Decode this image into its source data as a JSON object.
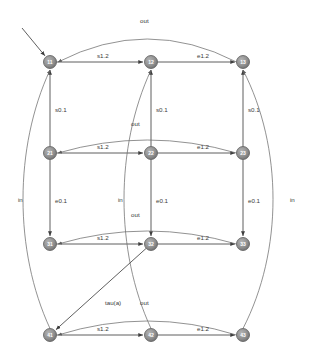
{
  "diagram": {
    "type": "automaton",
    "node_fill": "#8c8c8c",
    "node_stroke": "#5a5a5a",
    "edge_color": "#4d4d4d",
    "curve_color": "#6e6e6e",
    "label_color": "#3a3a3a",
    "node_radius": 6.5,
    "nodes": [
      {
        "id": "n11",
        "label": "11",
        "x": 50,
        "y": 62,
        "initial": true
      },
      {
        "id": "n12",
        "label": "12",
        "x": 151,
        "y": 62,
        "initial": false
      },
      {
        "id": "n13",
        "label": "13",
        "x": 243,
        "y": 62,
        "initial": false
      },
      {
        "id": "n21",
        "label": "21",
        "x": 50,
        "y": 153,
        "initial": false
      },
      {
        "id": "n22",
        "label": "22",
        "x": 151,
        "y": 153,
        "initial": false
      },
      {
        "id": "n23",
        "label": "23",
        "x": 243,
        "y": 153,
        "initial": false
      },
      {
        "id": "n31",
        "label": "31",
        "x": 50,
        "y": 244,
        "initial": false
      },
      {
        "id": "n32",
        "label": "32",
        "x": 151,
        "y": 244,
        "initial": false
      },
      {
        "id": "n33",
        "label": "33",
        "x": 243,
        "y": 244,
        "initial": false
      },
      {
        "id": "n41",
        "label": "41",
        "x": 50,
        "y": 335,
        "initial": false
      },
      {
        "id": "n42",
        "label": "42",
        "x": 151,
        "y": 335,
        "initial": false
      },
      {
        "id": "n43",
        "label": "43",
        "x": 243,
        "y": 335,
        "initial": false
      }
    ],
    "edges": [
      {
        "id": "e1",
        "from": "n11",
        "to": "n12",
        "label": "s1.2",
        "label_x": 97,
        "label_y": 56
      },
      {
        "id": "e2",
        "from": "n12",
        "to": "n13",
        "label": "e1.2",
        "label_x": 197,
        "label_y": 56
      },
      {
        "id": "e3",
        "from": "n21",
        "to": "n22",
        "label": "s1.2",
        "label_x": 97,
        "label_y": 147
      },
      {
        "id": "e4",
        "from": "n22",
        "to": "n23",
        "label": "e1.2",
        "label_x": 197,
        "label_y": 147
      },
      {
        "id": "e5",
        "from": "n31",
        "to": "n32",
        "label": "s1.2",
        "label_x": 97,
        "label_y": 238
      },
      {
        "id": "e6",
        "from": "n32",
        "to": "n33",
        "label": "e1.2",
        "label_x": 197,
        "label_y": 238
      },
      {
        "id": "e7",
        "from": "n41",
        "to": "n42",
        "label": "s1.2",
        "label_x": 97,
        "label_y": 329
      },
      {
        "id": "e8",
        "from": "n42",
        "to": "n43",
        "label": "e1.2",
        "label_x": 197,
        "label_y": 329
      },
      {
        "id": "e9",
        "from": "n21",
        "to": "n11",
        "label": "s0.1",
        "label_x": 55,
        "label_y": 110
      },
      {
        "id": "e10",
        "from": "n22",
        "to": "n12",
        "label": "s0.1",
        "label_x": 156,
        "label_y": 110
      },
      {
        "id": "e11",
        "from": "n23",
        "to": "n13",
        "label": "s0.1",
        "label_x": 248,
        "label_y": 110
      },
      {
        "id": "e12",
        "from": "n21",
        "to": "n31",
        "label": "e0.1",
        "label_x": 55,
        "label_y": 201
      },
      {
        "id": "e13",
        "from": "n22",
        "to": "n32",
        "label": "e0.1",
        "label_x": 156,
        "label_y": 201
      },
      {
        "id": "e14",
        "from": "n23",
        "to": "n33",
        "label": "e0.1",
        "label_x": 248,
        "label_y": 201
      },
      {
        "id": "e15",
        "from": "n13",
        "to": "n11",
        "label": "out",
        "label_x": 140,
        "label_y": 21
      },
      {
        "id": "e16",
        "from": "n23",
        "to": "n21",
        "label": "out",
        "label_x": 131,
        "label_y": 124
      },
      {
        "id": "e17",
        "from": "n33",
        "to": "n31",
        "label": "out",
        "label_x": 131,
        "label_y": 215
      },
      {
        "id": "e18",
        "from": "n43",
        "to": "n41",
        "label": "out",
        "label_x": 140,
        "label_y": 303
      },
      {
        "id": "e19",
        "from": "n41",
        "to": "n11",
        "label": "in",
        "label_x": 18,
        "label_y": 200
      },
      {
        "id": "e20",
        "from": "n42",
        "to": "n12",
        "label": "in",
        "label_x": 118,
        "label_y": 200
      },
      {
        "id": "e21",
        "from": "n43",
        "to": "n13",
        "label": "in",
        "label_x": 290,
        "label_y": 200
      },
      {
        "id": "e22",
        "from": "n32",
        "to": "n41",
        "label": "tau(a)",
        "label_x": 105,
        "label_y": 303
      }
    ],
    "alphabet": [
      "s1.2",
      "e1.2",
      "s0.1",
      "e0.1",
      "in",
      "out",
      "tau(a)"
    ]
  }
}
